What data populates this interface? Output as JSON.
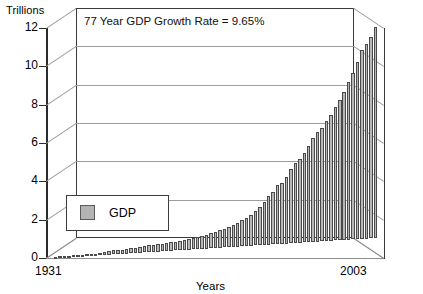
{
  "chart_data": {
    "type": "bar",
    "title": "",
    "subtitle": "",
    "xlabel": "Years",
    "ylabel": "Trillions",
    "ylim": [
      0,
      12
    ],
    "ytick_labels": [
      "0",
      "2",
      "4",
      "6",
      "8",
      "10",
      "12"
    ],
    "ytick_values": [
      0,
      2,
      4,
      6,
      8,
      10,
      12
    ],
    "grid": true,
    "grid_axis": "y",
    "legend": {
      "position": "inner-lower-left",
      "entries": [
        {
          "label": "GDP",
          "color": "#b7b7b7"
        }
      ]
    },
    "annotations": [
      {
        "text": "77 Year GDP Growth Rate = 9.65%",
        "position": "top-left-inside"
      }
    ],
    "x_axis_start_label": "1931",
    "x_axis_end_label": "2003",
    "categories": [
      "1931",
      "1932",
      "1933",
      "1934",
      "1935",
      "1936",
      "1937",
      "1938",
      "1939",
      "1940",
      "1941",
      "1942",
      "1943",
      "1944",
      "1945",
      "1946",
      "1947",
      "1948",
      "1949",
      "1950",
      "1951",
      "1952",
      "1953",
      "1954",
      "1955",
      "1956",
      "1957",
      "1958",
      "1959",
      "1960",
      "1961",
      "1962",
      "1963",
      "1964",
      "1965",
      "1966",
      "1967",
      "1968",
      "1969",
      "1970",
      "1971",
      "1972",
      "1973",
      "1974",
      "1975",
      "1976",
      "1977",
      "1978",
      "1979",
      "1980",
      "1981",
      "1982",
      "1983",
      "1984",
      "1985",
      "1986",
      "1987",
      "1988",
      "1989",
      "1990",
      "1991",
      "1992",
      "1993",
      "1994",
      "1995",
      "1996",
      "1997",
      "1998",
      "1999",
      "2000",
      "2001",
      "2002",
      "2003"
    ],
    "values": [
      0.077,
      0.06,
      0.057,
      0.066,
      0.074,
      0.085,
      0.093,
      0.087,
      0.093,
      0.103,
      0.129,
      0.166,
      0.203,
      0.224,
      0.228,
      0.228,
      0.25,
      0.275,
      0.273,
      0.3,
      0.347,
      0.367,
      0.389,
      0.391,
      0.426,
      0.45,
      0.474,
      0.482,
      0.522,
      0.543,
      0.563,
      0.605,
      0.638,
      0.685,
      0.743,
      0.815,
      0.862,
      0.943,
      1.02,
      1.076,
      1.168,
      1.282,
      1.429,
      1.549,
      1.689,
      1.878,
      2.086,
      2.357,
      2.632,
      2.863,
      3.211,
      3.345,
      3.638,
      4.041,
      4.347,
      4.59,
      4.87,
      5.253,
      5.658,
      5.98,
      6.174,
      6.539,
      6.879,
      7.309,
      7.664,
      8.1,
      8.609,
      9.089,
      9.661,
      10.285,
      10.622,
      10.978,
      11.51
    ],
    "peak_value": 11.51,
    "series_name": "GDP",
    "bar_color": "#b7b7b7",
    "bar_edge_color": "#4a4a4a",
    "style": "3d-perspective"
  }
}
